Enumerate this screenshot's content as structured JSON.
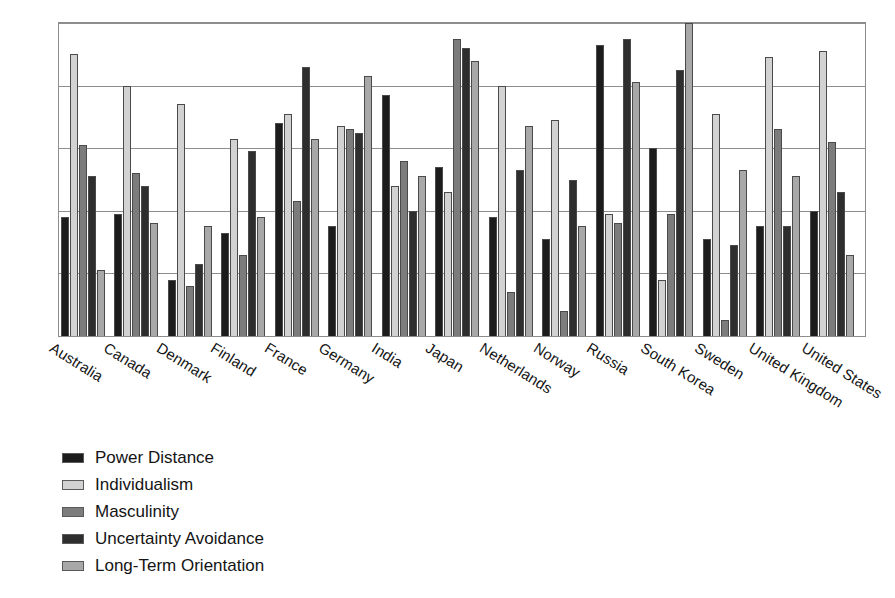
{
  "chart_data": {
    "type": "bar",
    "title": "",
    "subtitle": "",
    "xlabel": "",
    "ylabel": "",
    "ylim": [
      0,
      100
    ],
    "grid": true,
    "gridline_values": [
      0,
      20,
      40,
      60,
      80,
      100
    ],
    "legend_position": "below-left",
    "orientation": "vertical",
    "grouping": "grouped",
    "tick_label_rotation": 32,
    "categories": [
      "Australia",
      "Canada",
      "Denmark",
      "Finland",
      "France",
      "Germany",
      "India",
      "Japan",
      "Netherlands",
      "Norway",
      "Russia",
      "South Korea",
      "Sweden",
      "United Kingdom",
      "United States"
    ],
    "series": [
      {
        "name": "Power Distance",
        "color": "#1c1c1c",
        "values": [
          38,
          39,
          18,
          33,
          68,
          35,
          77,
          54,
          38,
          31,
          93,
          60,
          31,
          35,
          40
        ]
      },
      {
        "name": "Individualism",
        "color": "#d2d2d2",
        "values": [
          90,
          80,
          74,
          63,
          71,
          67,
          48,
          46,
          80,
          69,
          39,
          18,
          71,
          89,
          91
        ]
      },
      {
        "name": "Masculinity",
        "color": "#7c7c7c",
        "values": [
          61,
          52,
          16,
          26,
          43,
          66,
          56,
          95,
          14,
          8,
          36,
          39,
          5,
          66,
          62
        ]
      },
      {
        "name": "Uncertainty Avoidance",
        "color": "#2e2e2e",
        "values": [
          51,
          48,
          23,
          59,
          86,
          65,
          40,
          92,
          53,
          50,
          95,
          85,
          29,
          35,
          46
        ]
      },
      {
        "name": "Long-Term Orientation",
        "color": "#a8a8a8",
        "values": [
          21,
          36,
          35,
          38,
          63,
          83,
          51,
          88,
          67,
          35,
          81,
          100,
          53,
          51,
          26
        ]
      }
    ]
  },
  "legend": {
    "items": [
      {
        "label": "Power Distance",
        "color": "#1c1c1c"
      },
      {
        "label": "Individualism",
        "color": "#d2d2d2"
      },
      {
        "label": "Masculinity",
        "color": "#7c7c7c"
      },
      {
        "label": "Uncertainty Avoidance",
        "color": "#2e2e2e"
      },
      {
        "label": "Long-Term Orientation",
        "color": "#a8a8a8"
      }
    ]
  },
  "colors": {
    "axis": "#8d8d8d",
    "bar_outline": "#4a4a4a",
    "text": "#141414",
    "background": "#ffffff"
  }
}
